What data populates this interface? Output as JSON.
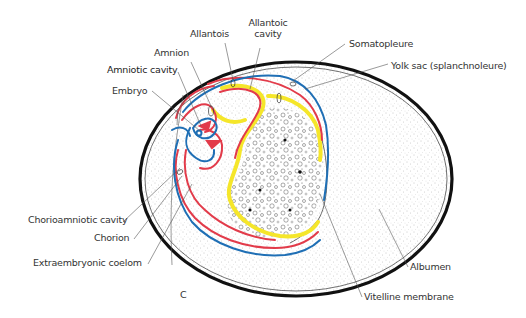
{
  "figure": {
    "panel_letter": "C",
    "colors": {
      "shell": "#111111",
      "albumen_stipple": "#9a9a9a",
      "ectoderm_blue": "#1f6fb5",
      "mesoderm_red": "#e23b4a",
      "endoderm_yellow": "#f5e62a",
      "leader_line": "#555555",
      "label_text": "#333333"
    }
  },
  "labels": {
    "allantois": "Allantois",
    "allantoic_cavity_1": "Allantoic",
    "allantoic_cavity_2": "cavity",
    "amnion": "Amnion",
    "amniotic_cavity": "Amniotic cavity",
    "embryo": "Embryo",
    "somatopleure": "Somatopleure",
    "yolk_sac": "Yolk sac (splanchnoleure)",
    "chorioamniotic_cavity": "Chorioamniotic cavity",
    "chorion": "Chorion",
    "extraembryonic_coelom": "Extraembryonic coelom",
    "albumen": "Albumen",
    "vitelline_membrane": "Vitelline membrane"
  }
}
